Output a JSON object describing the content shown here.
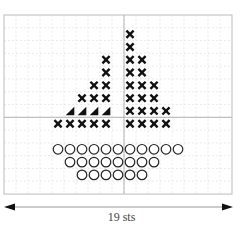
{
  "diagram": {
    "grid": {
      "columns": 19,
      "rows": 14,
      "left": 4,
      "top": 15,
      "cell_width": 12,
      "cell_height": 12.79,
      "center_column_line": 10,
      "center_row_line": 8,
      "border_color": "#bbbbbb",
      "gridline_color": "#e6e6e6",
      "center_line_color": "#aaaaaa"
    },
    "legend_symbols": {
      "x": "cross-stitch",
      "triangle": "half-stitch",
      "o": "circle-stitch"
    },
    "stitches": [
      {
        "row": 1,
        "cols": [
          10
        ],
        "symbol": "x"
      },
      {
        "row": 2,
        "cols": [
          10
        ],
        "symbol": "x"
      },
      {
        "row": 3,
        "cols": [
          8
        ],
        "symbol": "x"
      },
      {
        "row": 3,
        "cols": [
          10,
          11
        ],
        "symbol": "x"
      },
      {
        "row": 4,
        "cols": [
          8
        ],
        "symbol": "x"
      },
      {
        "row": 4,
        "cols": [
          10,
          11
        ],
        "symbol": "x"
      },
      {
        "row": 5,
        "cols": [
          7,
          8
        ],
        "symbol": "x"
      },
      {
        "row": 5,
        "cols": [
          10,
          11,
          12
        ],
        "symbol": "x"
      },
      {
        "row": 6,
        "cols": [
          6,
          7,
          8
        ],
        "symbol": "x"
      },
      {
        "row": 6,
        "cols": [
          10,
          11,
          12
        ],
        "symbol": "x"
      },
      {
        "row": 7,
        "cols": [
          5,
          6,
          7,
          8
        ],
        "symbol": "triangle"
      },
      {
        "row": 7,
        "cols": [
          10,
          11,
          12,
          13
        ],
        "symbol": "x"
      },
      {
        "row": 8,
        "cols": [
          4,
          5,
          6,
          7,
          8
        ],
        "symbol": "x"
      },
      {
        "row": 8,
        "cols": [
          10,
          11,
          12,
          13
        ],
        "symbol": "x"
      },
      {
        "row": 10,
        "cols": [
          4,
          5,
          6,
          7,
          8,
          9,
          10,
          11,
          12,
          13,
          14
        ],
        "symbol": "o"
      },
      {
        "row": 11,
        "cols": [
          5,
          6,
          7,
          8,
          9,
          10,
          11,
          12
        ],
        "symbol": "o"
      },
      {
        "row": 12,
        "cols": [
          6,
          7,
          8,
          9,
          10,
          11
        ],
        "symbol": "o"
      }
    ],
    "width_arrow": {
      "x1": 4,
      "x2": 233,
      "y": 207,
      "label": "19 sts"
    }
  }
}
